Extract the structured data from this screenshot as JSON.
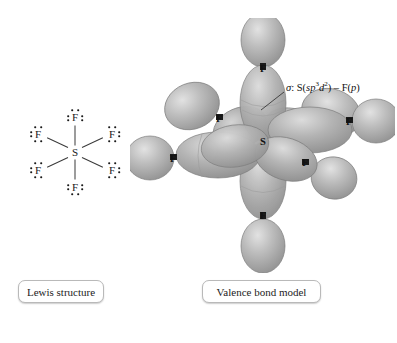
{
  "figure": {
    "background_color": "#ffffff"
  },
  "captions": {
    "lewis": "Lewis structure",
    "valence_bond": "Valence bond model"
  },
  "lewis_structure": {
    "central_atom": "S",
    "ligand_atom": "F",
    "ligand_count": 6,
    "lone_pairs_per_ligand": 3,
    "bond_count": 6,
    "atoms": [
      {
        "symbol": "S",
        "x": 47,
        "y": 47,
        "role": "central"
      },
      {
        "symbol": "F",
        "x": 47,
        "y": 12,
        "role": "ligand",
        "position": "top"
      },
      {
        "symbol": "F",
        "x": 47,
        "y": 82,
        "role": "ligand",
        "position": "bottom"
      },
      {
        "symbol": "F",
        "x": 10,
        "y": 29,
        "role": "ligand",
        "position": "upper-left"
      },
      {
        "symbol": "F",
        "x": 10,
        "y": 65,
        "role": "ligand",
        "position": "lower-left"
      },
      {
        "symbol": "F",
        "x": 84,
        "y": 29,
        "role": "ligand",
        "position": "upper-right"
      },
      {
        "symbol": "F",
        "x": 84,
        "y": 65,
        "role": "ligand",
        "position": "lower-right"
      }
    ]
  },
  "valence_bond_model": {
    "central_atom": "S",
    "central_position": {
      "x": 133,
      "y": 123
    },
    "hybridization": "sp3d2",
    "annotation": {
      "sigma": "σ",
      "colon": ":",
      "donor": "S(",
      "hybrid_base": "sp",
      "hybrid_exp1": "3",
      "hybrid_d": "d",
      "hybrid_exp2": "2",
      "close": ")",
      "dash": "–",
      "acceptor": "F(",
      "acceptor_orbital": "p",
      "acceptor_close": ")",
      "full_text": "σ: S(sp3d2) – F(p)"
    },
    "orbital_color": "#a9a9a9",
    "orbital_color_light": "#d2d2d2",
    "orbital_color_dark": "#8a8a8a",
    "fluorines": [
      {
        "label": "F",
        "x": 133,
        "y": 50,
        "direction": "up"
      },
      {
        "label": "F",
        "x": 133,
        "y": 197,
        "direction": "down"
      },
      {
        "label": "F",
        "x": 42,
        "y": 140,
        "direction": "left"
      },
      {
        "label": "F",
        "x": 219,
        "y": 103,
        "direction": "right"
      },
      {
        "label": "F",
        "x": 89,
        "y": 100,
        "direction": "back-left"
      },
      {
        "label": "F",
        "x": 175,
        "y": 145,
        "direction": "front-right"
      }
    ]
  }
}
